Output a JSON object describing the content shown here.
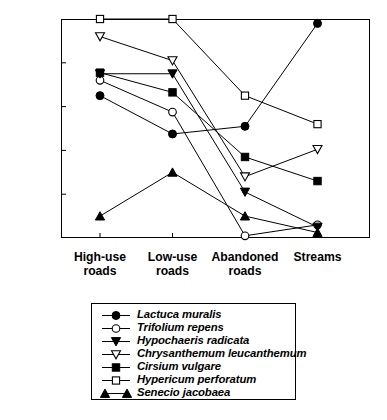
{
  "chart_data": {
    "type": "line",
    "title": "",
    "xlabel": "",
    "ylabel": "Proportion of sampling units",
    "categories": [
      "High-use roads",
      "Low-use roads",
      "Abandoned roads",
      "Streams"
    ],
    "category_lines": [
      [
        "High-use",
        "roads"
      ],
      [
        "Low-use",
        "roads"
      ],
      [
        "Abandoned",
        "roads"
      ],
      [
        "Streams",
        ""
      ]
    ],
    "ylim": [
      0.0,
      1.0
    ],
    "ytick_labels": [
      "1.0",
      "0.8",
      "0.6",
      "0.4",
      "0.2",
      "0.0"
    ],
    "ytick_values": [
      1.0,
      0.8,
      0.6,
      0.4,
      0.2,
      0.0
    ],
    "grid": false,
    "legend_position": "below-plot",
    "series": [
      {
        "name": "Lactuca muralis",
        "marker": "filled-circle",
        "values": [
          0.65,
          0.475,
          0.51,
          0.98
        ]
      },
      {
        "name": "Trifolium repens",
        "marker": "open-circle",
        "values": [
          0.72,
          0.575,
          0.01,
          0.06
        ]
      },
      {
        "name": "Hypochaeris radicata",
        "marker": "filled-down-triangle",
        "values": [
          0.75,
          0.75,
          0.21,
          0.05
        ]
      },
      {
        "name": "Chrysanthemum leucanthemum",
        "marker": "open-down-triangle",
        "values": [
          0.92,
          0.81,
          0.28,
          0.405
        ]
      },
      {
        "name": "Cirsium vulgare",
        "marker": "filled-square",
        "values": [
          0.755,
          0.665,
          0.37,
          0.26
        ]
      },
      {
        "name": "Hypericum perforatum",
        "marker": "open-square",
        "values": [
          1.0,
          1.0,
          0.65,
          0.52
        ]
      },
      {
        "name": "Senecio jacobaea",
        "marker": "filled-up-triangle",
        "values": [
          0.1,
          0.3,
          0.1,
          0.025
        ]
      }
    ]
  },
  "colors": {
    "line": "#000000",
    "marker_fill": "#000000",
    "marker_open": "#ffffff",
    "axis": "#000000",
    "background": "#ffffff"
  }
}
